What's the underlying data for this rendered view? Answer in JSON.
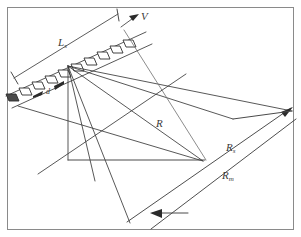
{
  "figure": {
    "background_color": "#ffffff",
    "frame_color": "#8a8a8a",
    "line_color": "#3a3a3a",
    "width": 301,
    "height": 237
  },
  "labels": {
    "aperture_length": {
      "base": "L",
      "sub": "s",
      "x": 60,
      "y": 42
    },
    "element_spacing": {
      "base": "d",
      "sub": "",
      "x": 47,
      "y": 91
    },
    "velocity": {
      "base": "V",
      "sub": "",
      "x": 143,
      "y": 16
    },
    "slant_range": {
      "base": "R",
      "sub": "",
      "x": 158,
      "y": 123
    },
    "swath_near": {
      "base": "R",
      "sub": "s",
      "x": 228,
      "y": 148
    },
    "swath_mid": {
      "base": "R",
      "sub": "m",
      "x": 224,
      "y": 176
    }
  },
  "array": {
    "element_count": 9,
    "element_shape": "parallelogram",
    "elements": [
      {
        "x": 15,
        "y": 98,
        "filled": true
      },
      {
        "x": 28,
        "y": 92,
        "filled": false
      },
      {
        "x": 41,
        "y": 86,
        "filled": false
      },
      {
        "x": 54,
        "y": 80,
        "filled": false
      },
      {
        "x": 67,
        "y": 74,
        "filled": false
      },
      {
        "x": 80,
        "y": 68,
        "filled": false
      },
      {
        "x": 93,
        "y": 62,
        "filled": false
      },
      {
        "x": 106,
        "y": 56,
        "filled": false
      },
      {
        "x": 119,
        "y": 50,
        "filled": false
      },
      {
        "x": 132,
        "y": 44,
        "filled": false
      }
    ]
  },
  "geometry": {
    "phase_center": {
      "x": 68,
      "y": 66
    },
    "array_axis": {
      "x1": 8,
      "y1": 96,
      "x2": 144,
      "y2": 34
    },
    "dimension_line": {
      "x1": 14,
      "y1": 78,
      "x2": 118,
      "y2": 14
    },
    "velocity_arrow": {
      "x1": 122,
      "y1": 26,
      "x2": 140,
      "y2": 14
    },
    "vertical_drop": {
      "x1": 68,
      "y1": 66,
      "x2": 68,
      "y2": 160
    },
    "ground_base": {
      "x1": 68,
      "y1": 160,
      "x2": 200,
      "y2": 160
    },
    "swath_near_line": {
      "x1": 128,
      "y1": 222,
      "x2": 290,
      "y2": 108
    },
    "swath_far_line": {
      "x1": 150,
      "y1": 228,
      "x2": 295,
      "y2": 118
    },
    "ray_targets": [
      {
        "x": 200,
        "y": 160
      },
      {
        "x": 230,
        "y": 118
      },
      {
        "x": 290,
        "y": 110
      },
      {
        "x": 152,
        "y": 88
      },
      {
        "x": 128,
        "y": 222
      },
      {
        "x": 100,
        "y": 180
      }
    ]
  },
  "arrows": {
    "bottom_arrow": {
      "tip_x": 152,
      "tip_y": 213,
      "tail_x": 186,
      "tail_y": 213,
      "direction": "left"
    },
    "right_arrow": {
      "tip_x": 290,
      "tip_y": 110,
      "direction": "up-right"
    },
    "spacing_arrow_left": {
      "tip_x": 38,
      "tip_y": 95,
      "direction": "left"
    },
    "spacing_arrow_right": {
      "tip_x": 60,
      "tip_y": 84,
      "direction": "up-right"
    }
  }
}
